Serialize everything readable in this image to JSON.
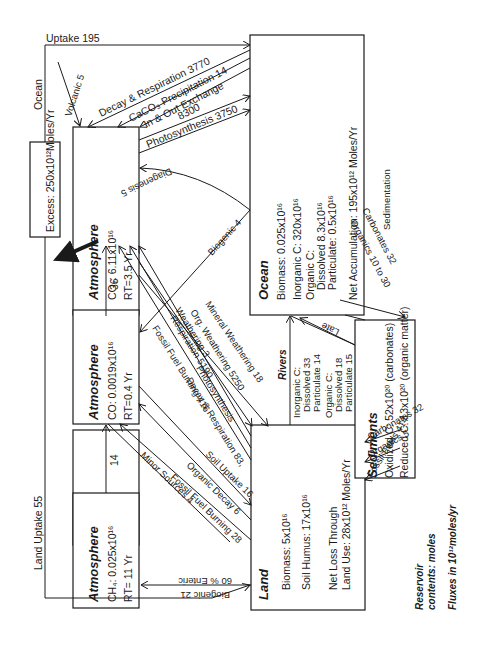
{
  "reservoirs": {
    "atm_co2": {
      "title": "Atmosphere",
      "l1": "CO₂: 6.11x10¹⁶",
      "l2": "RT=3.5 Yr"
    },
    "atm_co": {
      "title": "Atmosphere",
      "l1": "CO: 0.0019x10¹⁶",
      "l2": "RT=0.4 Yr"
    },
    "atm_ch4": {
      "title": "Atmosphere",
      "l1": "CH₄: 0.025x10¹⁶",
      "l2": "RT= 11 Yr"
    },
    "ocean": {
      "title": "Ocean",
      "l1": "Biomass: 0.025x10¹⁶",
      "l2": "Inorganic C:  320x10¹⁶",
      "l3": "Organic C:",
      "l4": "Dissolved 8.3x10¹⁶",
      "l5": "Particulate: 0.5x10¹⁶",
      "l6": "Net Accumulation: 195x10¹² Moles/Yr"
    },
    "land": {
      "title": "Land",
      "l1": "Biomass: 5x10¹⁶",
      "l2": "Soil Humus: 17x10¹⁶",
      "l3": "Net Loss Through",
      "l4": "Land Use: 28x10¹² Moles/Yr"
    },
    "sediments": {
      "title": "Sediments",
      "l1": "Oxidized C: 52x10²⁰     (carbonates)",
      "l2": "Reduced C: 13x10²⁰ (organic matter)"
    },
    "excess": {
      "label": "Excess: 250x10¹²Moles/Yr"
    }
  },
  "fluxes": {
    "ocean_uptake_a": "Ocean",
    "ocean_uptake_b": "Uptake 195",
    "volcanic": "Volcanic 5",
    "decay_resp": "Decay & Respiration 3770",
    "caco3": "CaCO₃ Precipitation 14",
    "exchange": "In & Out Exchange",
    "exchange_val": "8300",
    "photosynthesis": "Photosynthesis 3750",
    "diagenesis": "Diagenesis 5",
    "biogenic4": "Biogenic 4",
    "co_to_co2": "36",
    "ch4_to_co": "14",
    "weathering3": "Weathering 3",
    "fuel_burning": "Fossil Fuel Burning 416",
    "resp5190": "Respiration 5190",
    "decay_resp83": "Decay & Respiration 83,",
    "org_w": "Org. Weathering 5250",
    "land_use": "Land Use",
    "photo_land": "Photosynthesis",
    "mineral": "Mineral Weathering 18",
    "soil_uptake": "Soil Uptake 16",
    "organic_decay": "Organic Decay 6",
    "fuel_burning28": "Fossil Fuel Burning 28",
    "minor": "Minor Sources 4",
    "enteric": "60 % Enteric",
    "biogenic21": "Biogenic 21",
    "land_uptake": "Land Uptake 55",
    "rivers": "Rivers",
    "riv1": "Inorganic C:",
    "riv2": "Dissolved 33",
    "riv3": "Particulate 14",
    "riv4": "Organic C:",
    "riv5": "Dissolved 18",
    "riv6": "Particulate 15",
    "late": "Late",
    "sedimentation": "Sedimentation",
    "sed_carb": "Carbonates 32",
    "sed_org": "Organics 10 to 30",
    "land_carb": "Carbonates 32",
    "land_org": "Organics 5",
    "fossil_fuels": "Fossil Fuels 414"
  },
  "legend": {
    "l1": "Reservoir",
    "l2": "contents: moles",
    "l3": "Fluxes in 10¹²moles/yr"
  }
}
